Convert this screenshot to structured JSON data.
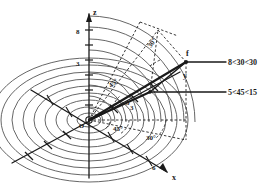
{
  "figure": {
    "type": "technical-line-diagram",
    "background_color": "#ffffff",
    "ink_color": "#1a1a1a",
    "contour_color": "#555555",
    "dashed_color": "#222222"
  },
  "axes": {
    "z": {
      "label": "z",
      "tick_labels": [
        "8",
        "3"
      ]
    },
    "x": {
      "label": "x",
      "tick_labels": [
        "6"
      ]
    },
    "y": {
      "label": "y",
      "tick_labels": [
        "3"
      ]
    },
    "origin_label": "O"
  },
  "annotations": {
    "point_f": "f",
    "angle_30_azimuth": "30°",
    "angle_45_azimuth": "45°",
    "angle_45_elevation": "45°",
    "angle_30_elevation": "30°",
    "radial_label": "5"
  },
  "callouts": [
    {
      "id": "vector-upper",
      "text": "8<30<30"
    },
    {
      "id": "vector-lower",
      "text": "5<45<15"
    }
  ],
  "contours": {
    "count": 9,
    "description": "concentric elliptical contour rings centered on origin"
  }
}
